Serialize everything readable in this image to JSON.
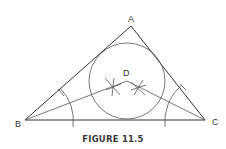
{
  "figure": {
    "caption": "FIGURE 11.5",
    "labels": {
      "A": "A",
      "B": "B",
      "C": "C",
      "D": "D"
    }
  },
  "colors": {
    "stroke": "#333333",
    "background": "#ffffff"
  }
}
